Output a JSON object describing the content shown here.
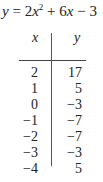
{
  "equation": {
    "lhs": "y",
    "equals": "=",
    "coef_a": "2",
    "var1": "x",
    "exp": "2",
    "plus": "+",
    "coef_b": "6",
    "var2": "x",
    "minus": "−",
    "const": "3"
  },
  "table": {
    "headers": [
      "x",
      "y"
    ],
    "rows": [
      {
        "x": "2",
        "y": "17"
      },
      {
        "x": "1",
        "y": "5"
      },
      {
        "x": "0",
        "y": "−3"
      },
      {
        "x": "−1",
        "y": "−7"
      },
      {
        "x": "−2",
        "y": "−7"
      },
      {
        "x": "−3",
        "y": "−3"
      },
      {
        "x": "−4",
        "y": "5"
      }
    ]
  }
}
